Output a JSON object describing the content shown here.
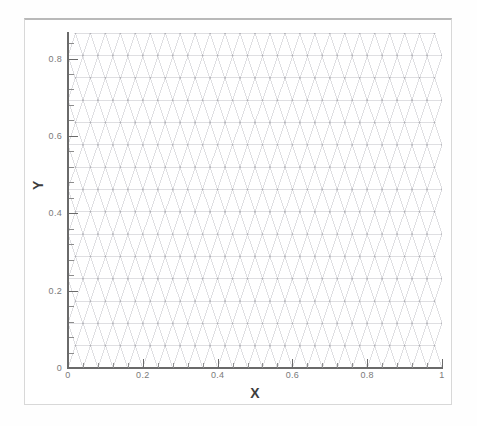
{
  "figure": {
    "kind": "triangular-mesh-plot",
    "background_color": "#ffffff",
    "frame_color": "#d8d8d8",
    "axis_color": "#6a6a6a",
    "mesh_color": "#d2d2d6",
    "node_color": "#b0b0b6"
  },
  "axes": {
    "x_title": "X",
    "y_title": "Y",
    "x_major_labels": [
      "0",
      "0.2",
      "0.4",
      "0.6",
      "0.8",
      "1"
    ],
    "x_major_values": [
      0,
      0.2,
      0.4,
      0.6,
      0.8,
      1
    ],
    "y_major_labels": [
      "0",
      "0.2",
      "0.4",
      "0.6",
      "0.8"
    ],
    "y_major_values": [
      0,
      0.2,
      0.4,
      0.6,
      0.8
    ],
    "x_minor_step": 0.04,
    "y_minor_step": 0.04
  },
  "chart_data": {
    "type": "scatter",
    "title": "",
    "subtitle": "",
    "xlabel": "X",
    "ylabel": "Y",
    "xlim": [
      0,
      1
    ],
    "ylim": [
      0,
      0.866
    ],
    "xticks": [
      0,
      0.2,
      0.4,
      0.6,
      0.8,
      1
    ],
    "xticklabels": [
      "0",
      "0.2",
      "0.4",
      "0.6",
      "0.8",
      "1"
    ],
    "yticks": [
      0,
      0.2,
      0.4,
      0.6,
      0.8
    ],
    "yticklabels": [
      "0",
      "0.2",
      "0.4",
      "0.6",
      "0.8"
    ],
    "grid": false,
    "legend": null,
    "annotations": [],
    "mesh": {
      "cell_shape": "equilateral-triangle",
      "spacing_x": 0.04,
      "spacing_y": 0.0577,
      "rows": 16,
      "cols": 26,
      "row_offset_x": 0.02,
      "edge_color": "#d2d2d6",
      "node_marker_color": "#b0b0b6",
      "node_marker_size": 0.9
    }
  }
}
